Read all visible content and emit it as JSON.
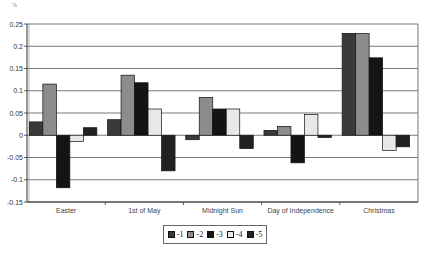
{
  "chart_data": {
    "type": "bar",
    "title": "",
    "unit_label": "%",
    "xlabel": "",
    "ylabel": "%",
    "ylim": [
      -0.15,
      0.25
    ],
    "yticks": [
      0.25,
      0.2,
      0.15,
      0.1,
      0.05,
      0,
      -0.05,
      -0.1,
      -0.15
    ],
    "ytick_labels": [
      "0.25",
      "0.2",
      "0.15",
      "0.1",
      "0.05",
      "0",
      "-0.05",
      "-0.1",
      "-0.15"
    ],
    "grid": true,
    "legend_position": "bottom",
    "categories": [
      "Easter",
      "1st of May",
      "Midnight Sun",
      "Day of Independence",
      "Christmas"
    ],
    "series": [
      {
        "name": "-1",
        "color": "#3a3a3a",
        "values": [
          0.03,
          0.035,
          -0.01,
          0.011,
          0.229
        ]
      },
      {
        "name": "-2",
        "color": "#8c8c8c",
        "values": [
          0.115,
          0.135,
          0.085,
          0.02,
          0.229
        ]
      },
      {
        "name": "-3",
        "color": "#141414",
        "values": [
          -0.118,
          0.118,
          0.059,
          -0.062,
          0.174
        ]
      },
      {
        "name": "-4",
        "color": "#e8e8e8",
        "values": [
          -0.014,
          0.059,
          0.059,
          0.047,
          -0.034
        ]
      },
      {
        "name": "-5",
        "color": "#222222",
        "values": [
          0.017,
          -0.08,
          -0.03,
          -0.005,
          -0.026
        ]
      }
    ]
  }
}
